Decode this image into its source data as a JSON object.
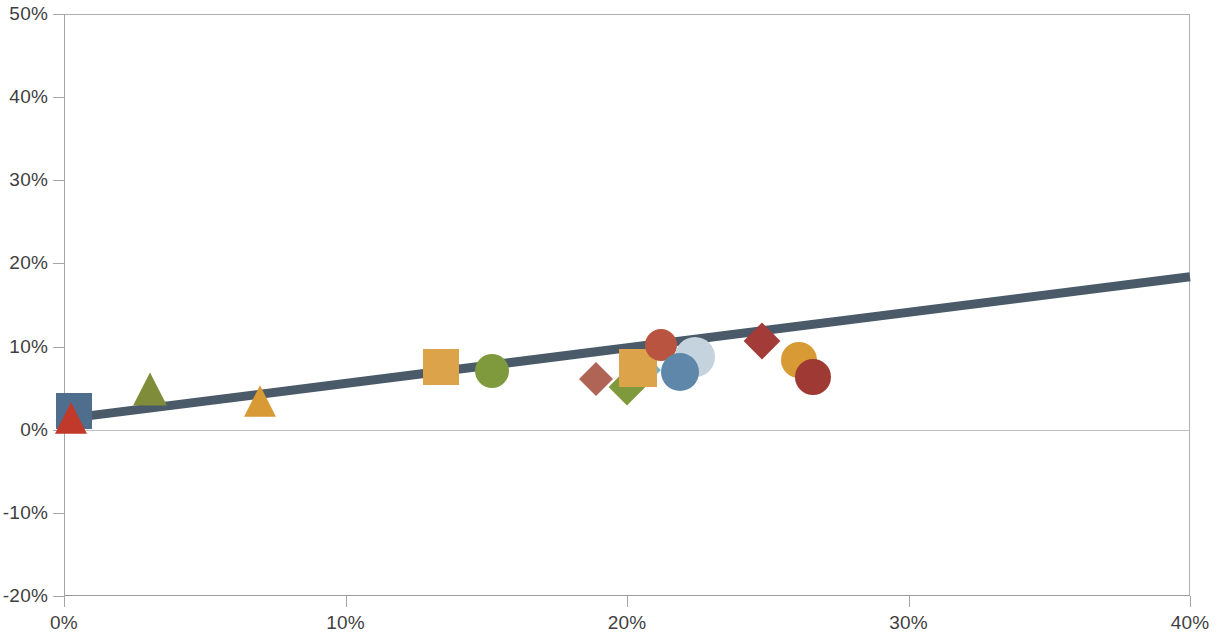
{
  "chart_data": {
    "type": "scatter",
    "title": "",
    "subtitle": "",
    "xlabel": "",
    "ylabel": "",
    "xlim": [
      0,
      40
    ],
    "ylim": [
      -20,
      50
    ],
    "x_ticks": [
      0,
      10,
      20,
      30,
      40
    ],
    "x_tick_labels": [
      "0%",
      "10%",
      "20%",
      "30%",
      "40%"
    ],
    "y_ticks": [
      -20,
      -10,
      0,
      10,
      20,
      30,
      40,
      50
    ],
    "y_tick_labels": [
      "-20%",
      "-10%",
      "0%",
      "10%",
      "20%",
      "30%",
      "40%",
      "50%"
    ],
    "grid": false,
    "legend": false,
    "legend_position": "none",
    "zero_reference_line": {
      "value": 0,
      "color": "#c3bfbf",
      "label": "0%"
    },
    "trendline": {
      "type": "linear",
      "color": "#4a5a68",
      "width": 9,
      "x_start": 0,
      "y_start": 1.3,
      "x_end": 40,
      "y_end": 18.4
    },
    "points": [
      {
        "id": "p01",
        "label": "",
        "x": 0.35,
        "y": 2.2,
        "marker": "square",
        "color": "#4f6d8c",
        "size": 36
      },
      {
        "id": "p02",
        "label": "",
        "x": 0.25,
        "y": 1.4,
        "marker": "triangle",
        "color": "#c0392b",
        "size": 34
      },
      {
        "id": "p03",
        "label": "",
        "x": 3.05,
        "y": 4.9,
        "marker": "triangle",
        "color": "#7f8c3a",
        "size": 36
      },
      {
        "id": "p04",
        "label": "",
        "x": 6.95,
        "y": 3.5,
        "marker": "triangle",
        "color": "#d79a34",
        "size": 34
      },
      {
        "id": "p05",
        "label": "",
        "x": 13.4,
        "y": 7.6,
        "marker": "square",
        "color": "#dda34a",
        "size": 36
      },
      {
        "id": "p06",
        "label": "",
        "x": 15.2,
        "y": 7.1,
        "marker": "circle",
        "color": "#7f9a3d",
        "size": 34
      },
      {
        "id": "p07",
        "label": "",
        "x": 18.9,
        "y": 6.1,
        "marker": "diamond",
        "color": "#b06456",
        "size": 34
      },
      {
        "id": "p08",
        "label": "",
        "x": 20.0,
        "y": 5.1,
        "marker": "diamond",
        "color": "#7f9a3d",
        "size": 36
      },
      {
        "id": "p09",
        "label": "",
        "x": 20.6,
        "y": 7.2,
        "marker": "diamond",
        "color": "#6db5cf",
        "size": 34
      },
      {
        "id": "p10",
        "label": "",
        "x": 20.4,
        "y": 7.4,
        "marker": "square",
        "color": "#dda34a",
        "size": 38
      },
      {
        "id": "p11",
        "label": "",
        "x": 21.2,
        "y": 10.2,
        "marker": "circle",
        "color": "#b8543f",
        "size": 32
      },
      {
        "id": "p12",
        "label": "",
        "x": 22.4,
        "y": 8.8,
        "marker": "circle",
        "color": "#c4d3dd",
        "size": 40
      },
      {
        "id": "p13",
        "label": "",
        "x": 21.9,
        "y": 6.9,
        "marker": "circle",
        "color": "#5f87aa",
        "size": 38
      },
      {
        "id": "p14",
        "label": "",
        "x": 24.8,
        "y": 10.7,
        "marker": "diamond",
        "color": "#a33c39",
        "size": 36
      },
      {
        "id": "p15",
        "label": "",
        "x": 26.1,
        "y": 8.4,
        "marker": "circle",
        "color": "#d79a34",
        "size": 36
      },
      {
        "id": "p16",
        "label": "",
        "x": 26.6,
        "y": 6.3,
        "marker": "circle",
        "color": "#9e3a33",
        "size": 36
      }
    ],
    "colors": {
      "axis": "#a6a6a6",
      "frame": "#b0b0b0",
      "tick_label": "#3f3f3f",
      "background": "#ffffff",
      "trendline": "#4a5a68"
    }
  }
}
